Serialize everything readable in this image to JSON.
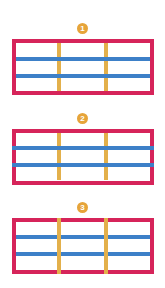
{
  "colors": {
    "frame": "#d6245a",
    "horizontal_line": "#3d80c8",
    "vertical_line": "#e3b04b",
    "badge": "#e6a43a",
    "badge_text": "#ffffff"
  },
  "panels": [
    {
      "badge": "1",
      "description": "Horizontal lines inside frame, drawn above vertical lines"
    },
    {
      "badge": "2",
      "description": "Horizontal lines extend over frame border, drawn above vertical lines"
    },
    {
      "badge": "3",
      "description": "Vertical lines extend over frame border, drawn above horizontal lines"
    }
  ]
}
